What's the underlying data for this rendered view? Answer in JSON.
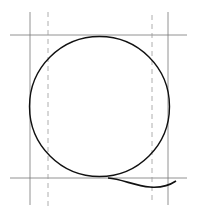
{
  "diagram": {
    "colors": {
      "stroke": "#111111",
      "guide": "#777777",
      "background": "#ffffff"
    },
    "guides": {
      "horizontal_solid": [
        35,
        178
      ],
      "vertical_solid": [
        30,
        168
      ],
      "vertical_dashed": [
        48,
        152
      ]
    },
    "circle": {
      "cx": 99,
      "cy": 106,
      "r": 70
    },
    "tail": {
      "start": [
        112,
        178
      ],
      "mid": [
        152,
        187
      ],
      "end": [
        176,
        181
      ]
    }
  }
}
